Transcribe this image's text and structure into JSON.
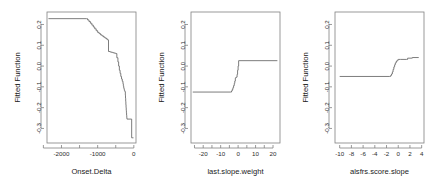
{
  "figure": {
    "type": "multi-panel-line",
    "panel_count": 3,
    "background_color": "#ffffff",
    "line_color": "#6e6e6e",
    "axis_color": "#808080",
    "text_color": "#1a1a1a"
  },
  "chart_data": [
    {
      "type": "line",
      "title": "",
      "xlabel": "Onset.Delta",
      "ylabel": "Fitted Function",
      "xlim": [
        -2400,
        60
      ],
      "ylim": [
        -0.37,
        0.26
      ],
      "xticks": [
        -2000,
        -1000,
        0
      ],
      "xtick_labels": [
        "-2000",
        "-1000",
        "0"
      ],
      "xminor_ticks": [
        -2500,
        -1500,
        -500
      ],
      "yticks": [
        0.2,
        0.1,
        0.0,
        -0.1,
        -0.2,
        -0.3
      ],
      "ytick_labels": [
        "0.2",
        "0.1",
        "0.0",
        "-0.1",
        "-0.2",
        "-0.3"
      ],
      "grid": false,
      "legend": "none",
      "step_shape": "hv",
      "x": [
        -2360,
        -1310,
        -1280,
        -1240,
        -1200,
        -1160,
        -1120,
        -1080,
        -1040,
        -1000,
        -960,
        -920,
        -880,
        -840,
        -800,
        -760,
        -720,
        -700,
        -660,
        -620,
        -580,
        -540,
        -500,
        -470,
        -440,
        -420,
        -400,
        -380,
        -360,
        -340,
        -320,
        -300,
        -290,
        -280,
        -270,
        -260,
        -250,
        -240,
        -235,
        -230,
        -225,
        -220,
        -215,
        -210,
        -205,
        -200,
        -195,
        -190,
        -60,
        -10
      ],
      "y": [
        0.228,
        0.228,
        0.222,
        0.214,
        0.206,
        0.197,
        0.188,
        0.179,
        0.17,
        0.162,
        0.156,
        0.15,
        0.145,
        0.14,
        0.135,
        0.13,
        0.125,
        0.07,
        0.068,
        0.066,
        0.064,
        0.062,
        0.06,
        0.04,
        0.02,
        0.0,
        -0.02,
        -0.035,
        -0.05,
        -0.062,
        -0.073,
        -0.085,
        -0.095,
        -0.104,
        -0.112,
        -0.118,
        -0.121,
        -0.124,
        -0.14,
        -0.155,
        -0.17,
        -0.185,
        -0.2,
        -0.213,
        -0.225,
        -0.237,
        -0.248,
        -0.255,
        -0.345,
        -0.345
      ]
    },
    {
      "type": "line",
      "title": "",
      "xlabel": "last.slope.weight",
      "ylabel": "Fitted Function",
      "xlim": [
        -27,
        24
      ],
      "ylim": [
        -0.37,
        0.26
      ],
      "xticks": [
        -20,
        -10,
        0,
        10,
        20
      ],
      "xtick_labels": [
        "-20",
        "-10",
        "0",
        "10",
        "20"
      ],
      "xminor_ticks": [
        -25,
        -15,
        -5,
        5,
        15
      ],
      "yticks": [
        0.2,
        0.1,
        0.0,
        -0.1,
        -0.2,
        -0.3
      ],
      "ytick_labels": [
        "0.2",
        "0.1",
        "0.0",
        "-0.1",
        "-0.2",
        "-0.3"
      ],
      "grid": false,
      "legend": "none",
      "step_shape": "hv",
      "x": [
        -26,
        -4.2,
        -3.8,
        -3.4,
        -3.0,
        -2.6,
        -2.2,
        -1.9,
        -1.6,
        -1.3,
        -1.0,
        -0.6,
        -0.3,
        0.0,
        0.3,
        22.5
      ],
      "y": [
        -0.125,
        -0.125,
        -0.12,
        -0.113,
        -0.104,
        -0.094,
        -0.083,
        -0.072,
        -0.058,
        -0.055,
        -0.053,
        -0.04,
        -0.02,
        0.0,
        0.026,
        0.026
      ]
    },
    {
      "type": "line",
      "title": "",
      "xlabel": "alsfrs.score.slope",
      "ylabel": "Fitted Function",
      "xlim": [
        -10.8,
        4.4
      ],
      "ylim": [
        -0.37,
        0.26
      ],
      "xticks": [
        -10,
        -8,
        -6,
        -4,
        -2,
        0,
        2,
        4
      ],
      "xtick_labels": [
        "-10",
        "-8",
        "-6",
        "-4",
        "-2",
        "0",
        "2",
        "4"
      ],
      "yticks": [
        0.2,
        0.1,
        0.0,
        -0.1,
        -0.2,
        -0.3
      ],
      "ytick_labels": [
        "0.2",
        "0.1",
        "0.0",
        "-0.1",
        "-0.2",
        "-0.3"
      ],
      "grid": false,
      "legend": "none",
      "step_shape": "hv",
      "x": [
        -10.0,
        -1.45,
        -1.3,
        -1.15,
        -1.0,
        -0.88,
        -0.75,
        -0.62,
        -0.5,
        -0.35,
        -0.2,
        0.0,
        0.4,
        1.4,
        1.6,
        2.2,
        2.4,
        3.5
      ],
      "y": [
        -0.05,
        -0.05,
        -0.045,
        -0.038,
        -0.028,
        -0.016,
        -0.004,
        0.006,
        0.015,
        0.022,
        0.028,
        0.032,
        0.032,
        0.032,
        0.038,
        0.038,
        0.041,
        0.041
      ]
    }
  ]
}
